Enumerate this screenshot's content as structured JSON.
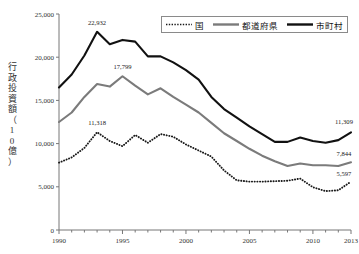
{
  "chart_data": {
    "type": "line",
    "title": "",
    "xlabel": "",
    "ylabel": "行政投資額（10億）",
    "ylabel_chars": [
      "行",
      "政",
      "投",
      "資",
      "額",
      "（",
      "1",
      "0",
      "億",
      "）"
    ],
    "xlim": [
      1990,
      2013
    ],
    "ylim": [
      0,
      25000
    ],
    "grid": false,
    "legend_position": "top-right",
    "x": [
      1990,
      1991,
      1992,
      1993,
      1994,
      1995,
      1996,
      1997,
      1998,
      1999,
      2000,
      2001,
      2002,
      2003,
      2004,
      2005,
      2006,
      2007,
      2008,
      2009,
      2010,
      2011,
      2012,
      2013
    ],
    "xticks": [
      1990,
      1995,
      2000,
      2005,
      2010,
      2013
    ],
    "xtick_labels": [
      "1990",
      "1995",
      "2000",
      "2005",
      "2010",
      "2013"
    ],
    "yticks": [
      0,
      5000,
      10000,
      15000,
      20000,
      25000
    ],
    "ytick_labels": [
      "0",
      "5,000",
      "10,000",
      "15,000",
      "20,000",
      "25,000"
    ],
    "series": [
      {
        "name": "国",
        "style": "dotted",
        "color": "#1a1a1a",
        "values": [
          7800,
          8400,
          9500,
          11318,
          10300,
          9700,
          11000,
          10100,
          11100,
          10800,
          9900,
          9200,
          8500,
          6900,
          5750,
          5600,
          5600,
          5650,
          5700,
          5950,
          4950,
          4500,
          4600,
          5597
        ]
      },
      {
        "name": "都道府県",
        "style": "solid",
        "color": "#7b7b7b",
        "values": [
          12500,
          13600,
          15400,
          16900,
          16600,
          17799,
          16700,
          15700,
          16400,
          15400,
          14500,
          13600,
          12400,
          11200,
          10300,
          9400,
          8600,
          7950,
          7400,
          7700,
          7500,
          7500,
          7400,
          7844
        ]
      },
      {
        "name": "市町村",
        "style": "solid",
        "color": "#111111",
        "values": [
          16500,
          18000,
          20200,
          22932,
          21500,
          22000,
          21800,
          20100,
          20100,
          19400,
          18500,
          17400,
          15400,
          14000,
          13000,
          12000,
          11100,
          10200,
          10200,
          10700,
          10300,
          10100,
          10400,
          11309
        ]
      }
    ],
    "annotations": [
      {
        "label": "22,932",
        "series": "市町村",
        "x": 1993,
        "y": 22932
      },
      {
        "label": "17,799",
        "series": "都道府県",
        "x": 1995,
        "y": 17799
      },
      {
        "label": "11,318",
        "series": "国",
        "x": 1993,
        "y": 11318
      },
      {
        "label": "11,309",
        "series": "市町村",
        "x": 2013,
        "y": 11309
      },
      {
        "label": "7,844",
        "series": "都道府県",
        "x": 2013,
        "y": 7844
      },
      {
        "label": "5,597",
        "series": "国",
        "x": 2013,
        "y": 5597
      }
    ]
  },
  "legend": {
    "items": [
      {
        "label": "国",
        "style": "dotted",
        "color": "#1a1a1a"
      },
      {
        "label": "都道府県",
        "style": "solid",
        "color": "#7b7b7b"
      },
      {
        "label": "市町村",
        "style": "solid",
        "color": "#111111"
      }
    ]
  }
}
